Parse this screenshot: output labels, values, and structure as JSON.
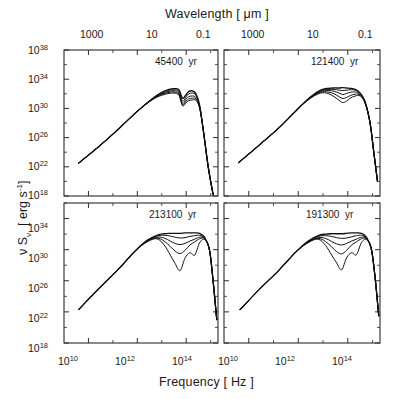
{
  "figure": {
    "top_axis_title": "Wavelength   [ μm ]",
    "bottom_axis_title": "Frequency   [ Hz ]",
    "y_axis_title_nu": "ν S",
    "y_axis_title_sub": "ν",
    "y_axis_title_units": "[ erg s",
    "y_axis_title_exp": "-1",
    "y_axis_title_close": "]",
    "background": "#ffffff",
    "curve_color": "#111111"
  },
  "top_ticks": {
    "labels": [
      "1000",
      "10",
      "0.1"
    ]
  },
  "bottom_ticks": {
    "mant": "10",
    "exps": [
      "10",
      "12",
      "14"
    ]
  },
  "y_ticks_top_panel": {
    "mant": "10",
    "exps": [
      "38",
      "34",
      "30",
      "26",
      "22",
      "18"
    ]
  },
  "y_ticks_bottom_panel": {
    "mant": "10",
    "exps": [
      "34",
      "30",
      "26",
      "22",
      "18"
    ]
  },
  "panels": [
    {
      "id": "panel-top-left",
      "age": "45400",
      "unit": "yr"
    },
    {
      "id": "panel-top-right",
      "age": "121400",
      "unit": "yr"
    },
    {
      "id": "panel-bottom-left",
      "age": "213100",
      "unit": "yr"
    },
    {
      "id": "panel-bottom-right",
      "age": "191300",
      "unit": "yr"
    }
  ],
  "chart_data": {
    "type": "line",
    "xlabel": "Frequency   [ Hz ]",
    "ylabel": "ν Sν  [ erg s^-1 ]",
    "top_xlabel": "Wavelength   [ μm ]",
    "xscale": "log",
    "yscale": "log",
    "xlim": [
      1000000000.0,
      2000000000000000.0
    ],
    "xticks": [
      10000000000.0,
      1000000000000.0,
      100000000000000.0
    ],
    "top_xticks_um": [
      1000,
      10,
      0.1
    ],
    "grid": false,
    "legend": "none",
    "panel_annotation_units": "yr",
    "panels": [
      {
        "name": "45400 yr",
        "ylim": [
          1e+18,
          1e+38
        ],
        "yticks": [
          1e+18,
          1e+22,
          1e+26,
          1e+30,
          1e+34,
          1e+38
        ],
        "series": [
          {
            "name": "i=0",
            "x_log": [
              9.6,
              10.5,
              11.3,
              12.0,
              12.6,
              13.0,
              13.3,
              13.5,
              13.7,
              13.85,
              14.0,
              14.1,
              14.25,
              14.4,
              14.55,
              14.7,
              14.9,
              15.1
            ],
            "y_log": [
              22.5,
              25.0,
              27.4,
              29.6,
              31.3,
              32.2,
              32.6,
              32.7,
              32.55,
              31.4,
              31.9,
              32.3,
              32.4,
              32.0,
              30.4,
              27.0,
              22.0,
              18.2
            ]
          },
          {
            "name": "i=1",
            "x_log": [
              9.6,
              10.5,
              11.3,
              12.0,
              12.6,
              13.0,
              13.3,
              13.5,
              13.7,
              13.85,
              14.0,
              14.1,
              14.25,
              14.4,
              14.55,
              14.7,
              14.9,
              15.1
            ],
            "y_log": [
              22.5,
              25.0,
              27.4,
              29.6,
              31.3,
              32.1,
              32.5,
              32.55,
              32.35,
              31.0,
              31.6,
              32.0,
              32.1,
              31.8,
              30.3,
              27.0,
              22.0,
              18.2
            ]
          },
          {
            "name": "i=2",
            "x_log": [
              9.6,
              10.5,
              11.3,
              12.0,
              12.6,
              13.0,
              13.3,
              13.5,
              13.7,
              13.85,
              14.0,
              14.1,
              14.25,
              14.4,
              14.55,
              14.7,
              14.9,
              15.1
            ],
            "y_log": [
              22.5,
              25.0,
              27.4,
              29.6,
              31.25,
              32.0,
              32.35,
              32.4,
              32.15,
              30.7,
              31.3,
              31.6,
              31.7,
              31.5,
              30.2,
              27.0,
              22.0,
              18.2
            ]
          },
          {
            "name": "i=3",
            "x_log": [
              9.6,
              10.5,
              11.3,
              12.0,
              12.6,
              13.0,
              13.3,
              13.5,
              13.7,
              13.85,
              14.0,
              14.1,
              14.25,
              14.4,
              14.55,
              14.7,
              14.9,
              15.1
            ],
            "y_log": [
              22.5,
              25.0,
              27.4,
              29.6,
              31.2,
              31.9,
              32.2,
              32.25,
              31.95,
              30.5,
              31.0,
              31.3,
              31.4,
              31.3,
              30.1,
              27.0,
              22.0,
              18.2
            ]
          },
          {
            "name": "i=4",
            "x_log": [
              9.6,
              10.5,
              11.3,
              12.0,
              12.6,
              13.0,
              13.3,
              13.5,
              13.7,
              13.85,
              14.0,
              14.1,
              14.25,
              14.4,
              14.55,
              14.7,
              14.9,
              15.1
            ],
            "y_log": [
              22.5,
              25.0,
              27.4,
              29.6,
              31.15,
              31.8,
              32.05,
              32.1,
              31.8,
              30.35,
              30.8,
              31.05,
              31.15,
              31.1,
              30.0,
              27.0,
              22.0,
              18.2
            ]
          }
        ]
      },
      {
        "name": "121400 yr",
        "ylim": [
          1e+18,
          1e+38
        ],
        "yticks": [
          1e+18,
          1e+22,
          1e+26,
          1e+30,
          1e+34,
          1e+38
        ],
        "series": [
          {
            "name": "i=0",
            "x_log": [
              9.6,
              10.5,
              11.3,
              12.0,
              12.5,
              12.9,
              13.2,
              13.45,
              13.65,
              13.8,
              13.95,
              14.1,
              14.3,
              14.5,
              14.7,
              14.9,
              15.05,
              15.2
            ],
            "y_log": [
              22.6,
              25.2,
              27.6,
              30.0,
              31.6,
              32.5,
              32.75,
              32.8,
              32.8,
              32.85,
              32.8,
              32.75,
              32.6,
              32.1,
              30.9,
              28.0,
              24.0,
              20.0
            ]
          },
          {
            "name": "i=1",
            "x_log": [
              9.6,
              10.5,
              11.3,
              12.0,
              12.5,
              12.9,
              13.2,
              13.45,
              13.65,
              13.8,
              13.95,
              14.1,
              14.3,
              14.5,
              14.7,
              14.9,
              15.05,
              15.2
            ],
            "y_log": [
              22.6,
              25.2,
              27.6,
              30.0,
              31.55,
              32.4,
              32.6,
              32.6,
              32.5,
              32.45,
              32.5,
              32.55,
              32.5,
              32.0,
              30.85,
              28.0,
              24.0,
              20.0
            ]
          },
          {
            "name": "i=2",
            "x_log": [
              9.6,
              10.5,
              11.3,
              12.0,
              12.5,
              12.9,
              13.2,
              13.45,
              13.65,
              13.8,
              13.95,
              14.1,
              14.3,
              14.5,
              14.7,
              14.9,
              15.05,
              15.2
            ],
            "y_log": [
              22.6,
              25.2,
              27.6,
              30.0,
              31.5,
              32.3,
              32.45,
              32.35,
              32.1,
              31.9,
              32.05,
              32.2,
              32.25,
              31.9,
              30.8,
              28.0,
              24.0,
              20.0
            ]
          },
          {
            "name": "i=3",
            "x_log": [
              9.6,
              10.5,
              11.3,
              12.0,
              12.5,
              12.9,
              13.2,
              13.45,
              13.65,
              13.8,
              13.95,
              14.1,
              14.3,
              14.5,
              14.7,
              14.9,
              15.05,
              15.2
            ],
            "y_log": [
              22.6,
              25.2,
              27.6,
              30.0,
              31.45,
              32.2,
              32.25,
              32.0,
              31.6,
              31.35,
              31.5,
              31.75,
              31.95,
              31.8,
              30.75,
              28.0,
              24.0,
              20.0
            ]
          },
          {
            "name": "i=4",
            "x_log": [
              9.6,
              10.5,
              11.3,
              12.0,
              12.5,
              12.9,
              13.2,
              13.45,
              13.65,
              13.8,
              13.95,
              14.1,
              14.3,
              14.5,
              14.7,
              14.9,
              15.05,
              15.2
            ],
            "y_log": [
              22.6,
              25.2,
              27.6,
              30.0,
              31.4,
              32.1,
              32.05,
              31.6,
              31.1,
              30.8,
              31.0,
              31.4,
              31.7,
              31.7,
              30.7,
              28.0,
              24.0,
              20.0
            ]
          }
        ]
      },
      {
        "name": "213100 yr",
        "ylim": [
          1e+18,
          1e+36
        ],
        "yticks": [
          1e+18,
          1e+22,
          1e+26,
          1e+30,
          1e+34
        ],
        "series": [
          {
            "name": "i=0",
            "x_log": [
              9.6,
              10.4,
              11.2,
              11.9,
              12.4,
              12.8,
              13.1,
              13.35,
              13.55,
              13.75,
              13.95,
              14.15,
              14.35,
              14.55,
              14.75,
              14.95,
              15.1,
              15.25
            ],
            "y_log": [
              22.3,
              24.9,
              27.4,
              29.8,
              31.2,
              31.85,
              32.05,
              32.1,
              32.1,
              32.1,
              32.15,
              32.15,
              32.15,
              32.1,
              31.6,
              30.0,
              26.0,
              21.0
            ]
          },
          {
            "name": "i=1",
            "x_log": [
              9.6,
              10.4,
              11.2,
              11.9,
              12.4,
              12.8,
              13.1,
              13.35,
              13.55,
              13.75,
              13.95,
              14.15,
              14.35,
              14.55,
              14.75,
              14.95,
              15.1,
              15.25
            ],
            "y_log": [
              22.3,
              24.9,
              27.4,
              29.8,
              31.15,
              31.75,
              31.85,
              31.75,
              31.6,
              31.5,
              31.55,
              31.7,
              31.8,
              31.85,
              31.5,
              30.0,
              26.0,
              21.0
            ]
          },
          {
            "name": "i=2",
            "x_log": [
              9.6,
              10.4,
              11.2,
              11.9,
              12.4,
              12.8,
              13.1,
              13.35,
              13.55,
              13.75,
              13.95,
              14.15,
              14.35,
              14.55,
              14.75,
              14.95,
              15.1,
              15.25
            ],
            "y_log": [
              22.3,
              24.9,
              27.4,
              29.8,
              31.1,
              31.6,
              31.5,
              31.1,
              30.8,
              30.65,
              30.8,
              31.1,
              31.35,
              31.6,
              31.45,
              30.0,
              26.0,
              21.0
            ]
          },
          {
            "name": "i=3",
            "x_log": [
              9.6,
              10.4,
              11.2,
              11.9,
              12.4,
              12.8,
              13.1,
              13.35,
              13.55,
              13.75,
              13.95,
              14.15,
              14.35,
              14.55,
              14.75,
              14.95,
              15.1,
              15.25
            ],
            "y_log": [
              22.3,
              24.9,
              27.4,
              29.8,
              31.05,
              31.5,
              31.1,
              30.4,
              29.8,
              29.5,
              29.9,
              30.6,
              31.0,
              31.4,
              31.4,
              30.0,
              26.0,
              21.0
            ]
          },
          {
            "name": "i=4",
            "x_log": [
              9.6,
              10.4,
              11.2,
              11.9,
              12.4,
              12.8,
              13.1,
              13.35,
              13.55,
              13.75,
              13.95,
              14.15,
              14.35,
              14.55,
              14.75,
              14.95,
              15.1,
              15.25
            ],
            "y_log": [
              22.3,
              24.9,
              27.4,
              29.8,
              31.0,
              31.4,
              30.6,
              29.3,
              28.2,
              27.3,
              28.9,
              29.6,
              29.3,
              30.9,
              31.3,
              30.0,
              26.0,
              21.0
            ]
          }
        ]
      },
      {
        "name": "191300 yr",
        "ylim": [
          1e+18,
          1e+36
        ],
        "yticks": [
          1e+18,
          1e+22,
          1e+26,
          1e+30,
          1e+34
        ],
        "series": [
          {
            "name": "i=0",
            "x_log": [
              9.65,
              10.4,
              11.2,
              11.9,
              12.4,
              12.8,
              13.1,
              13.35,
              13.55,
              13.75,
              13.95,
              14.15,
              14.35,
              14.55,
              14.75,
              14.95,
              15.1,
              15.25
            ],
            "y_log": [
              22.3,
              24.8,
              27.3,
              29.7,
              31.1,
              31.8,
              32.0,
              32.05,
              32.05,
              32.05,
              32.1,
              32.15,
              32.15,
              32.1,
              31.6,
              30.1,
              26.5,
              21.5
            ]
          },
          {
            "name": "i=1",
            "x_log": [
              9.65,
              10.4,
              11.2,
              11.9,
              12.4,
              12.8,
              13.1,
              13.35,
              13.55,
              13.75,
              13.95,
              14.15,
              14.35,
              14.55,
              14.75,
              14.95,
              15.1,
              15.25
            ],
            "y_log": [
              22.3,
              24.8,
              27.3,
              29.7,
              31.05,
              31.7,
              31.8,
              31.7,
              31.55,
              31.45,
              31.5,
              31.65,
              31.8,
              31.85,
              31.5,
              30.1,
              26.5,
              21.5
            ]
          },
          {
            "name": "i=2",
            "x_log": [
              9.65,
              10.4,
              11.2,
              11.9,
              12.4,
              12.8,
              13.1,
              13.35,
              13.55,
              13.75,
              13.95,
              14.15,
              14.35,
              14.55,
              14.75,
              14.95,
              15.1,
              15.25
            ],
            "y_log": [
              22.3,
              24.8,
              27.3,
              29.7,
              31.0,
              31.55,
              31.45,
              31.05,
              30.75,
              30.6,
              30.8,
              31.1,
              31.35,
              31.6,
              31.45,
              30.1,
              26.5,
              21.5
            ]
          },
          {
            "name": "i=3",
            "x_log": [
              9.65,
              10.4,
              11.2,
              11.9,
              12.4,
              12.8,
              13.1,
              13.35,
              13.55,
              13.75,
              13.95,
              14.15,
              14.35,
              14.55,
              14.75,
              14.95,
              15.1,
              15.25
            ],
            "y_log": [
              22.3,
              24.8,
              27.3,
              29.7,
              30.95,
              31.45,
              31.05,
              30.35,
              29.75,
              29.45,
              29.9,
              30.6,
              31.0,
              31.4,
              31.4,
              30.1,
              26.5,
              21.5
            ]
          },
          {
            "name": "i=4",
            "x_log": [
              9.65,
              10.4,
              11.2,
              11.9,
              12.4,
              12.8,
              13.1,
              13.35,
              13.55,
              13.75,
              13.95,
              14.15,
              14.35,
              14.55,
              14.75,
              14.95,
              15.1,
              15.25
            ],
            "y_log": [
              22.3,
              24.8,
              27.3,
              29.7,
              30.9,
              31.35,
              30.55,
              29.3,
              28.3,
              27.4,
              28.95,
              29.6,
              29.35,
              30.9,
              31.3,
              30.1,
              26.5,
              21.5
            ]
          }
        ]
      }
    ]
  }
}
